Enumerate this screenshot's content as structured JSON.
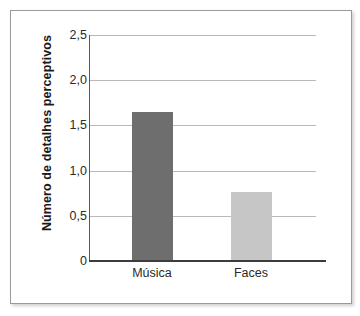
{
  "chart_data": {
    "type": "bar",
    "title": "",
    "subtitle": "",
    "xlabel": "",
    "ylabel": "Número de detalhes perceptivos",
    "categories": [
      "Música",
      "Faces"
    ],
    "values": [
      1.65,
      0.76
    ],
    "ylim": [
      0,
      2.5
    ],
    "y_ticks": [
      0,
      0.5,
      1.0,
      1.5,
      2.0,
      2.5
    ],
    "y_tick_labels": [
      "0",
      "0,5",
      "1,0",
      "1,5",
      "2,0",
      "2,5"
    ],
    "grid": true,
    "grid_axis": "y",
    "legend": false,
    "legend_position": "none",
    "bar_colors": [
      "#6e6e6e",
      "#c6c6c6"
    ],
    "series": [
      {
        "name": "Número de detalhes perceptivos",
        "values": [
          1.65,
          0.76
        ]
      }
    ],
    "annotations": []
  },
  "figure": {
    "frame_border_color": "#9a9a9a",
    "background_color": "#ffffff",
    "axis_color": "#3c3c3c",
    "gridline_color": "#b9b9b9"
  }
}
